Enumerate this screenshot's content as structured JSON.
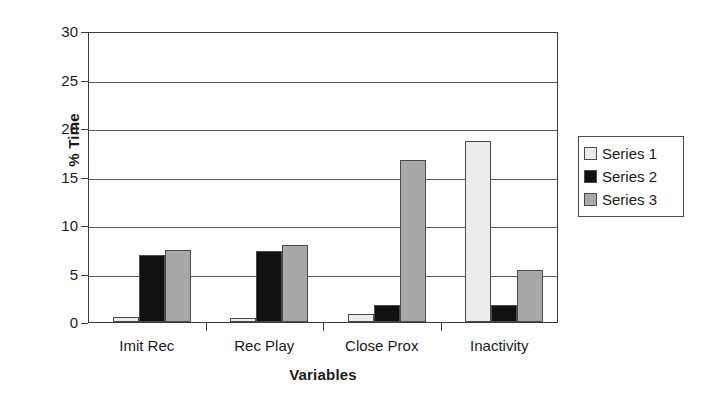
{
  "chart_data": {
    "type": "bar",
    "title": "",
    "xlabel": "Variables",
    "ylabel": "% Time",
    "categories": [
      "Imit Rec",
      "Rec Play",
      "Close Prox",
      "Inactivity"
    ],
    "series": [
      {
        "name": "Series 1",
        "color": "#ececec",
        "values": [
          0.5,
          0.4,
          0.8,
          18.7
        ]
      },
      {
        "name": "Series 2",
        "color": "#111111",
        "values": [
          6.9,
          7.3,
          1.8,
          1.8
        ]
      },
      {
        "name": "Series 3",
        "color": "#a8a8a8",
        "values": [
          7.4,
          7.9,
          16.7,
          5.4
        ]
      }
    ],
    "ylim": [
      0,
      30
    ],
    "yticks": [
      0,
      5,
      10,
      15,
      20,
      25,
      30
    ],
    "ytick_labels": [
      "0",
      "5",
      "10",
      "15",
      "20",
      "25",
      "30"
    ],
    "grid": "horizontal",
    "legend_position": "right",
    "legend_entries": [
      "Series 1",
      "Series 2",
      "Series 3"
    ],
    "axis_color": "#3a3a3a",
    "grid_color": "#5a5a5a",
    "background": "#ffffff"
  }
}
